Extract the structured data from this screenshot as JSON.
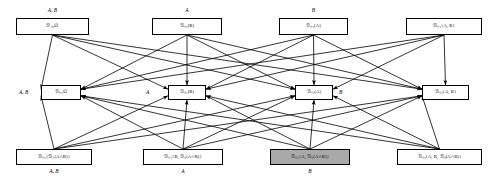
{
  "diagram": {
    "type": "belief-revision-lattice",
    "title": "",
    "rows": 3,
    "columns": 4,
    "colors": {
      "node_fill": "#ffffff",
      "node_shaded_fill": "#a9a9a9",
      "stroke": "#000000",
      "background": "#ffffff"
    },
    "nodes": [
      {
        "id": "t1",
        "row": "top",
        "col": 1,
        "text": "ℬₛ₀∅",
        "tag": "A, B",
        "tag_pos": "above",
        "shaded": false,
        "x": 16,
        "y": 18,
        "w": 73,
        "h": 17
      },
      {
        "id": "t2",
        "row": "top",
        "col": 2,
        "text": "ℬₛ₁(B)",
        "tag": "A",
        "tag_pos": "above",
        "shaded": false,
        "x": 152,
        "y": 18,
        "w": 70,
        "h": 17
      },
      {
        "id": "t3",
        "row": "top",
        "col": 3,
        "text": "ℬₛ₂(A)",
        "tag": "B",
        "tag_pos": "above",
        "shaded": false,
        "x": 279,
        "y": 18,
        "w": 69,
        "h": 17
      },
      {
        "id": "t4",
        "row": "top",
        "col": 4,
        "text": "ℬₛ₃{A, B}",
        "tag": "",
        "tag_pos": "none",
        "shaded": false,
        "x": 406,
        "y": 18,
        "w": 76,
        "h": 17
      },
      {
        "id": "m1",
        "row": "middle",
        "col": 1,
        "text": "ℬₛ₀∅",
        "tag": "A, B",
        "tag_pos": "left",
        "shaded": false,
        "x": 41,
        "y": 85,
        "w": 40,
        "h": 15
      },
      {
        "id": "m2",
        "row": "middle",
        "col": 2,
        "text": "ℬₛ₁(B)",
        "tag": "A",
        "tag_pos": "left",
        "shaded": false,
        "x": 168,
        "y": 85,
        "w": 38,
        "h": 15
      },
      {
        "id": "m3",
        "row": "middle",
        "col": 3,
        "text": "ℬₛ₂(A)",
        "tag": "B",
        "tag_pos": "right",
        "shaded": false,
        "x": 295,
        "y": 85,
        "w": 38,
        "h": 15
      },
      {
        "id": "m4",
        "row": "middle",
        "col": 4,
        "text": "ℬₛ₃{A, B}",
        "tag": "",
        "tag_pos": "none",
        "shaded": false,
        "x": 422,
        "y": 85,
        "w": 47,
        "h": 15
      },
      {
        "id": "b1",
        "row": "bottom",
        "col": 1,
        "text": "ℬₛ₀{ℬₛ(A∩B)}",
        "tag": "A, B",
        "tag_pos": "below",
        "shaded": false,
        "x": 16,
        "y": 149,
        "w": 76,
        "h": 16
      },
      {
        "id": "b2",
        "row": "bottom",
        "col": 2,
        "text": "ℬₛ₁{B, ℬₛ(A∩B)}",
        "tag": "A",
        "tag_pos": "below",
        "shaded": false,
        "x": 143,
        "y": 149,
        "w": 80,
        "h": 16
      },
      {
        "id": "b3",
        "row": "bottom",
        "col": 3,
        "text": "ℬₛ₂{A, ℬₛ(A∩B)}",
        "tag": "B",
        "tag_pos": "below",
        "shaded": true,
        "x": 270,
        "y": 149,
        "w": 80,
        "h": 16
      },
      {
        "id": "b4",
        "row": "bottom",
        "col": 4,
        "text": "ℬₛ₃{A, B, ℬₛ(A∩B)}",
        "tag": "",
        "tag_pos": "none",
        "shaded": false,
        "x": 397,
        "y": 149,
        "w": 85,
        "h": 16
      }
    ],
    "edges": [
      {
        "from": "t1",
        "to": "m1"
      },
      {
        "from": "t2",
        "to": "m2"
      },
      {
        "from": "t3",
        "to": "m3"
      },
      {
        "from": "t4",
        "to": "m4"
      },
      {
        "from": "b1",
        "to": "m1"
      },
      {
        "from": "b2",
        "to": "m2"
      },
      {
        "from": "b3",
        "to": "m3"
      },
      {
        "from": "b4",
        "to": "m4"
      },
      {
        "from": "t1",
        "to": "m2"
      },
      {
        "from": "t1",
        "to": "m3"
      },
      {
        "from": "t1",
        "to": "m4"
      },
      {
        "from": "t2",
        "to": "m1"
      },
      {
        "from": "t2",
        "to": "m3"
      },
      {
        "from": "t2",
        "to": "m4"
      },
      {
        "from": "t3",
        "to": "m1"
      },
      {
        "from": "t3",
        "to": "m2"
      },
      {
        "from": "t3",
        "to": "m4"
      },
      {
        "from": "t4",
        "to": "m1"
      },
      {
        "from": "t4",
        "to": "m2"
      },
      {
        "from": "t4",
        "to": "m3"
      },
      {
        "from": "b1",
        "to": "m2"
      },
      {
        "from": "b1",
        "to": "m3"
      },
      {
        "from": "b1",
        "to": "m4"
      },
      {
        "from": "b2",
        "to": "m1"
      },
      {
        "from": "b2",
        "to": "m3"
      },
      {
        "from": "b2",
        "to": "m4"
      },
      {
        "from": "b3",
        "to": "m1"
      },
      {
        "from": "b3",
        "to": "m2"
      },
      {
        "from": "b3",
        "to": "m4"
      },
      {
        "from": "b4",
        "to": "m1"
      },
      {
        "from": "b4",
        "to": "m2"
      },
      {
        "from": "b4",
        "to": "m3"
      }
    ]
  }
}
